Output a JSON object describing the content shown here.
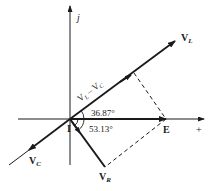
{
  "diagram": {
    "type": "phasor-diagram",
    "colors": {
      "ink": "#1a1a1a",
      "background": "#ffffff"
    },
    "axes": {
      "imaginary_label": "j",
      "real_label": "+"
    },
    "labels": {
      "VL": {
        "main": "V",
        "sub": "L"
      },
      "VC": {
        "main": "V",
        "sub": "C"
      },
      "VR": {
        "main": "V",
        "sub": "R"
      },
      "E": "E",
      "I": "I",
      "VL_minus_VC": {
        "a_main": "V",
        "a_sub": "L",
        "op": "–",
        "b_main": "V",
        "b_sub": "C"
      }
    },
    "angles": {
      "upper": "36.87°",
      "lower": "53.13°"
    }
  }
}
